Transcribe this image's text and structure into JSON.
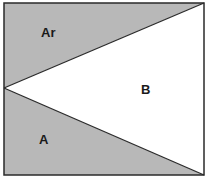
{
  "diagram": {
    "regions": [
      {
        "id": "Ar",
        "label": "Ar",
        "fill": "#b8b8b8"
      },
      {
        "id": "B",
        "label": "B",
        "fill": "#ffffff"
      },
      {
        "id": "A",
        "label": "A",
        "fill": "#b8b8b8"
      }
    ],
    "colors": {
      "shade": "#b8b8b8",
      "stroke": "#2a2a2a",
      "background": "#ffffff"
    }
  }
}
